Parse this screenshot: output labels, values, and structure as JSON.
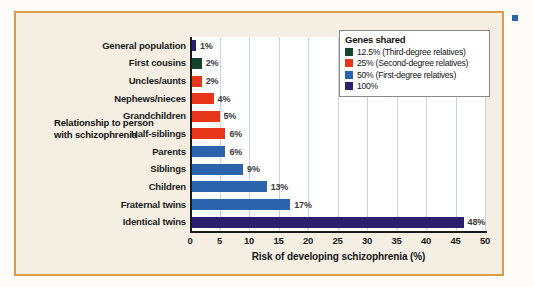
{
  "figure": {
    "border_color": "#e09a42",
    "background_color": "#f4efe2",
    "plot_background_color": "#ffffff"
  },
  "yaxis_title": "Relationship to person with schizophrenia",
  "legend": {
    "title": "Genes shared",
    "items": [
      {
        "label": "12.5% (Third-degree relatives)",
        "color": "#13442b"
      },
      {
        "label": "25% (Second-degree relatives)",
        "color": "#e8361b"
      },
      {
        "label": "50% (First-degree relatives)",
        "color": "#2b63ad"
      },
      {
        "label": "100%",
        "color": "#2b1f6e"
      }
    ]
  },
  "side_caption": {
    "lines": [
      "",
      "",
      "",
      "",
      ""
    ]
  },
  "chart_data": {
    "type": "bar",
    "orientation": "horizontal",
    "title": "",
    "xlabel": "Risk of developing schizophrenia (%)",
    "ylabel": "Relationship to person with schizophrenia",
    "xlim": [
      0,
      50
    ],
    "xticks": [
      0,
      5,
      10,
      15,
      20,
      25,
      30,
      35,
      40,
      45,
      50
    ],
    "grid": "vertical",
    "legend_position": "top-right",
    "categories": [
      "General population",
      "First cousins",
      "Uncles/aunts",
      "Nephews/nieces",
      "Grandchildren",
      "Half-siblings",
      "Parents",
      "Siblings",
      "Children",
      "Fraternal twins",
      "Identical twins"
    ],
    "values": [
      1,
      2,
      2,
      4,
      5,
      6,
      6,
      9,
      13,
      17,
      48
    ],
    "value_labels": [
      "1%",
      "2%",
      "2%",
      "4%",
      "5%",
      "6%",
      "6%",
      "9%",
      "13%",
      "17%",
      "48%"
    ],
    "bar_colors": [
      "#2b1f6e",
      "#13442b",
      "#e8361b",
      "#e8361b",
      "#e8361b",
      "#e8361b",
      "#2b63ad",
      "#2b63ad",
      "#2b63ad",
      "#2b63ad",
      "#2b1f6e"
    ],
    "genes_shared_group": [
      "100%",
      "12.5%",
      "25%",
      "25%",
      "25%",
      "25%",
      "50%",
      "50%",
      "50%",
      "50%",
      "100%"
    ]
  }
}
